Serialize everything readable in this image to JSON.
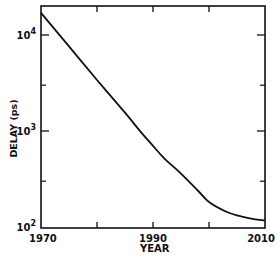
{
  "chart_data": {
    "type": "line",
    "title": "",
    "xlabel": "YEAR",
    "ylabel": "DELAY (ps)",
    "yscale": "log",
    "xlim": [
      1970,
      2010
    ],
    "ylim": [
      100,
      20000
    ],
    "x_ticks": [
      1970,
      1980,
      1990,
      2000,
      2010
    ],
    "x_tick_labels": [
      "1970",
      "",
      "1990",
      "",
      "2010"
    ],
    "y_ticks": [
      100,
      1000,
      10000
    ],
    "y_tick_labels": [
      {
        "base": "10",
        "exp": "2"
      },
      {
        "base": "10",
        "exp": "3"
      },
      {
        "base": "10",
        "exp": "4"
      }
    ],
    "y_minor_ticks": [
      300,
      3000
    ],
    "grid": false,
    "legend": null,
    "series": [
      {
        "name": "delay",
        "x": [
          1970,
          1975,
          1980,
          1985,
          1988,
          1990,
          1992,
          1995,
          1998,
          2000,
          2003,
          2005,
          2008,
          2010
        ],
        "values": [
          17000,
          7600,
          3400,
          1550,
          950,
          700,
          520,
          360,
          240,
          182,
          145,
          132,
          121,
          117
        ]
      }
    ]
  },
  "labels": {
    "x_axis_title": "YEAR",
    "y_axis_title": "DELAY (ps)"
  }
}
